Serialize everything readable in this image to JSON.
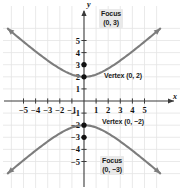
{
  "chart_data": {
    "type": "line",
    "title": "",
    "subtitle": "",
    "xlabel": "x",
    "ylabel": "y",
    "xlim": [
      -6.2,
      6.2
    ],
    "ylim": [
      -6.2,
      6.2
    ],
    "grid": true,
    "legend": null,
    "xticks": [
      -5,
      -4,
      -3,
      -2,
      -1,
      1,
      2,
      3,
      4,
      5
    ],
    "yticks": [
      -5,
      -4,
      -3,
      -2,
      -1,
      1,
      2,
      3,
      4,
      5
    ],
    "xticklabels": [
      "−5",
      "−4",
      "−3",
      "−2",
      "−1",
      "1",
      "2",
      "3",
      "4",
      "5"
    ],
    "yticklabels": [
      "−5",
      "−4",
      "−3",
      "−2",
      "−1",
      "1",
      "2",
      "3",
      "4",
      "5"
    ],
    "curve_equation": "y^2/4 - x^2/5 = 1",
    "curve_color": "#7a7a7a",
    "grid_color": "#e2e2e2",
    "axis_color": "#3a3a3a",
    "series": [
      {
        "name": "upper-branch",
        "values": [
          [
            -6.0,
            -6.3
          ],
          [
            -5.5,
            -5.89
          ],
          [
            -5.0,
            -5.48
          ],
          [
            -4.5,
            -5.09
          ],
          [
            -4.0,
            -4.72
          ],
          [
            -3.5,
            -4.36
          ],
          [
            -3.0,
            -4.02
          ],
          [
            -2.5,
            -3.71
          ],
          [
            -2.0,
            -3.44
          ],
          [
            -1.5,
            -3.2
          ],
          [
            -1.0,
            -3.02
          ],
          [
            -0.5,
            -2.9
          ],
          [
            0.0,
            -2.0
          ],
          [
            0.5,
            -2.9
          ],
          [
            1.0,
            -3.02
          ],
          [
            1.5,
            -3.2
          ],
          [
            2.0,
            -3.44
          ],
          [
            2.5,
            -3.71
          ],
          [
            3.0,
            -4.02
          ],
          [
            3.5,
            -4.36
          ],
          [
            4.0,
            -4.72
          ],
          [
            4.5,
            -5.09
          ],
          [
            5.0,
            -5.48
          ],
          [
            5.5,
            -5.89
          ],
          [
            6.0,
            -6.3
          ]
        ]
      },
      {
        "name": "lower-branch",
        "values": []
      }
    ],
    "points": [
      {
        "name": "focus-top",
        "x": 0,
        "y": 3,
        "label": "Focus (0, 3)"
      },
      {
        "name": "vertex-top",
        "x": 0,
        "y": 2,
        "label": "Vertex (0, 2)"
      },
      {
        "name": "vertex-bot",
        "x": 0,
        "y": -2,
        "label": "Vertex (0, −2)"
      },
      {
        "name": "focus-bot",
        "x": 0,
        "y": -3,
        "label": "Focus (0, −3)"
      }
    ]
  },
  "annotations": {
    "focus_top": {
      "line1": "Focus",
      "line2": "(0, 3)"
    },
    "vertex_top": {
      "text": "Vertex (0, 2)"
    },
    "vertex_bottom": {
      "text": "Vertex (0, −2)"
    },
    "focus_bottom": {
      "line1": "Focus",
      "line2": "(0, −3)"
    }
  },
  "axes": {
    "x_name": "x",
    "y_name": "y"
  }
}
